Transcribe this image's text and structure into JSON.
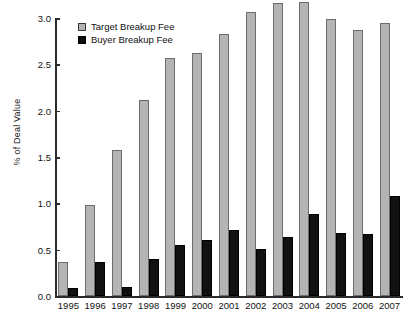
{
  "chart_data": {
    "type": "bar",
    "title": "",
    "xlabel": "",
    "ylabel": "% of Deal Value",
    "ylim": [
      0.0,
      3.0
    ],
    "ytick_labels": [
      "0.0",
      "0.5",
      "1.0",
      "1.5",
      "2.0",
      "2.5",
      "3.0"
    ],
    "ytick_values": [
      0.0,
      0.5,
      1.0,
      1.5,
      2.0,
      2.5,
      3.0
    ],
    "grid": false,
    "legend_position": "top-left",
    "categories": [
      "1995",
      "1996",
      "1997",
      "1998",
      "1999",
      "2000",
      "2001",
      "2002",
      "2003",
      "2004",
      "2005",
      "2006",
      "2007"
    ],
    "series": [
      {
        "name": "Target Breakup Fee",
        "color": "#b4b4b4",
        "values": [
          0.37,
          0.98,
          1.58,
          2.12,
          2.57,
          2.62,
          2.83,
          3.06,
          3.16,
          3.17,
          2.99,
          2.87,
          2.95
        ]
      },
      {
        "name": "Buyer Breakup Fee",
        "color": "#111111",
        "values": [
          0.09,
          0.37,
          0.1,
          0.4,
          0.55,
          0.6,
          0.71,
          0.51,
          0.64,
          0.88,
          0.68,
          0.67,
          1.08
        ]
      }
    ]
  }
}
